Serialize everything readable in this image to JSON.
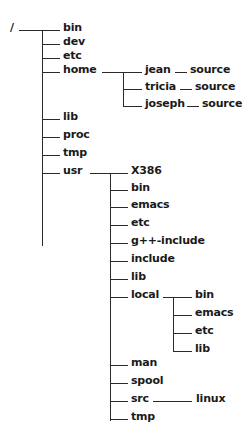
{
  "tree": {
    "root": {
      "label": "/",
      "x": 10,
      "y": 21
    },
    "lines": [
      {
        "t": "h",
        "x": 19,
        "y": 30,
        "w": 23
      },
      {
        "t": "v",
        "x": 42,
        "y": 30,
        "h": 216
      },
      {
        "t": "h",
        "x": 42,
        "y": 30,
        "w": 18
      },
      {
        "t": "h",
        "x": 42,
        "y": 44,
        "w": 18
      },
      {
        "t": "h",
        "x": 42,
        "y": 58,
        "w": 18
      },
      {
        "t": "h",
        "x": 42,
        "y": 72,
        "w": 18
      },
      {
        "t": "h",
        "x": 42,
        "y": 119,
        "w": 18
      },
      {
        "t": "h",
        "x": 42,
        "y": 137,
        "w": 18
      },
      {
        "t": "h",
        "x": 42,
        "y": 155,
        "w": 18
      },
      {
        "t": "h",
        "x": 42,
        "y": 173,
        "w": 18
      },
      {
        "t": "h",
        "x": 102,
        "y": 72,
        "w": 40
      },
      {
        "t": "v",
        "x": 123,
        "y": 72,
        "h": 35
      },
      {
        "t": "h",
        "x": 123,
        "y": 89,
        "w": 19
      },
      {
        "t": "h",
        "x": 123,
        "y": 106,
        "w": 19
      },
      {
        "t": "h",
        "x": 175,
        "y": 72,
        "w": 12
      },
      {
        "t": "h",
        "x": 180,
        "y": 89,
        "w": 12
      },
      {
        "t": "h",
        "x": 187,
        "y": 106,
        "w": 12
      },
      {
        "t": "h",
        "x": 90,
        "y": 173,
        "w": 38
      },
      {
        "t": "v",
        "x": 110,
        "y": 173,
        "h": 248
      },
      {
        "t": "h",
        "x": 110,
        "y": 190,
        "w": 18
      },
      {
        "t": "h",
        "x": 110,
        "y": 207,
        "w": 18
      },
      {
        "t": "h",
        "x": 110,
        "y": 225,
        "w": 18
      },
      {
        "t": "h",
        "x": 110,
        "y": 243,
        "w": 18
      },
      {
        "t": "h",
        "x": 110,
        "y": 261,
        "w": 18
      },
      {
        "t": "h",
        "x": 110,
        "y": 279,
        "w": 18
      },
      {
        "t": "h",
        "x": 110,
        "y": 297,
        "w": 18
      },
      {
        "t": "h",
        "x": 110,
        "y": 365,
        "w": 18
      },
      {
        "t": "h",
        "x": 110,
        "y": 383,
        "w": 18
      },
      {
        "t": "h",
        "x": 110,
        "y": 401,
        "w": 18
      },
      {
        "t": "h",
        "x": 110,
        "y": 419,
        "w": 18
      },
      {
        "t": "h",
        "x": 163,
        "y": 297,
        "w": 29
      },
      {
        "t": "v",
        "x": 173,
        "y": 297,
        "h": 54
      },
      {
        "t": "h",
        "x": 173,
        "y": 315,
        "w": 19
      },
      {
        "t": "h",
        "x": 173,
        "y": 333,
        "w": 19
      },
      {
        "t": "h",
        "x": 173,
        "y": 351,
        "w": 19
      },
      {
        "t": "h",
        "x": 153,
        "y": 401,
        "w": 39
      }
    ],
    "nodes": [
      {
        "id": "bin",
        "label": "bin",
        "x": 63,
        "y": 21
      },
      {
        "id": "dev",
        "label": "dev",
        "x": 63,
        "y": 35
      },
      {
        "id": "etc",
        "label": "etc",
        "x": 63,
        "y": 49
      },
      {
        "id": "home",
        "label": "home",
        "x": 63,
        "y": 63
      },
      {
        "id": "lib",
        "label": "lib",
        "x": 63,
        "y": 110
      },
      {
        "id": "proc",
        "label": "proc",
        "x": 63,
        "y": 128
      },
      {
        "id": "tmp",
        "label": "tmp",
        "x": 63,
        "y": 146
      },
      {
        "id": "usr",
        "label": "usr",
        "x": 63,
        "y": 164
      },
      {
        "id": "home-jean",
        "label": "jean",
        "x": 145,
        "y": 63
      },
      {
        "id": "home-tricia",
        "label": "tricia",
        "x": 145,
        "y": 80
      },
      {
        "id": "home-joseph",
        "label": "joseph",
        "x": 145,
        "y": 97
      },
      {
        "id": "jean-source",
        "label": "source",
        "x": 190,
        "y": 63
      },
      {
        "id": "tricia-source",
        "label": "source",
        "x": 195,
        "y": 80
      },
      {
        "id": "joseph-source",
        "label": "source",
        "x": 202,
        "y": 97
      },
      {
        "id": "usr-x386",
        "label": "X386",
        "x": 131,
        "y": 164
      },
      {
        "id": "usr-bin",
        "label": "bin",
        "x": 131,
        "y": 181
      },
      {
        "id": "usr-emacs",
        "label": "emacs",
        "x": 131,
        "y": 198
      },
      {
        "id": "usr-etc",
        "label": "etc",
        "x": 131,
        "y": 216
      },
      {
        "id": "usr-gpp-include",
        "label": "g++-include",
        "x": 131,
        "y": 234
      },
      {
        "id": "usr-include",
        "label": "include",
        "x": 131,
        "y": 252
      },
      {
        "id": "usr-lib",
        "label": "lib",
        "x": 131,
        "y": 270
      },
      {
        "id": "usr-local",
        "label": "local",
        "x": 131,
        "y": 288
      },
      {
        "id": "usr-man",
        "label": "man",
        "x": 131,
        "y": 356
      },
      {
        "id": "usr-spool",
        "label": "spool",
        "x": 131,
        "y": 374
      },
      {
        "id": "usr-src",
        "label": "src",
        "x": 131,
        "y": 392
      },
      {
        "id": "usr-tmp",
        "label": "tmp",
        "x": 131,
        "y": 410
      },
      {
        "id": "local-bin",
        "label": "bin",
        "x": 195,
        "y": 288
      },
      {
        "id": "local-emacs",
        "label": "emacs",
        "x": 195,
        "y": 306
      },
      {
        "id": "local-etc",
        "label": "etc",
        "x": 195,
        "y": 324
      },
      {
        "id": "local-lib",
        "label": "lib",
        "x": 195,
        "y": 342
      },
      {
        "id": "src-linux",
        "label": "linux",
        "x": 196,
        "y": 392
      }
    ]
  }
}
